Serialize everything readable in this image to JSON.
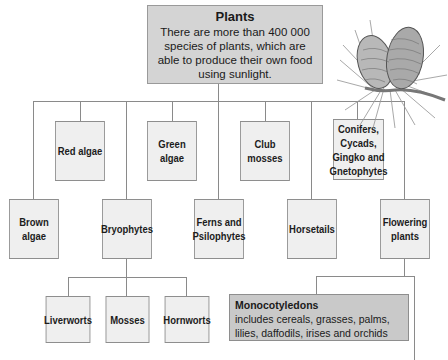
{
  "root": {
    "title": "Plants",
    "description": "There are more than 400 000 species of plants, which are able to produce their own food using sunlight."
  },
  "row1": [
    {
      "label": "Red algae"
    },
    {
      "label": "Green algae"
    },
    {
      "label": "Club\nmosses"
    },
    {
      "label": "Conifers,\nCycads,\nGingko and\nGnetophytes"
    }
  ],
  "row2": [
    {
      "label": "Brown\nalgae"
    },
    {
      "label": "Bryophytes"
    },
    {
      "label": "Ferns and\nPsilophytes"
    },
    {
      "label": "Horsetails"
    },
    {
      "label": "Flowering\nplants"
    }
  ],
  "bryophytes_children": [
    {
      "label": "Liverworts"
    },
    {
      "label": "Mosses"
    },
    {
      "label": "Hornworts"
    }
  ],
  "flowering_children": {
    "monocotyledons": {
      "title": "Monocotyledons",
      "description": "includes cereals, grasses, palms, lilies, daffodils, irises and orchids"
    }
  },
  "illustration": {
    "icon": "pine-cones-icon"
  },
  "colors": {
    "root_fill": "#d4d4d4",
    "box_fill": "#efefef",
    "mono_fill": "#c9c9c9",
    "line": "#8a8a8a"
  }
}
